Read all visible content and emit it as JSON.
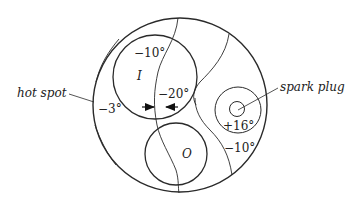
{
  "diagram": {
    "labels": {
      "hot_spot": "hot spot",
      "spark_plug": "spark plug",
      "intake_valve": "I",
      "outlet_valve": "O"
    },
    "temperatures": {
      "intake_top": "−10°",
      "between_valves": "−20°",
      "left_region": "−3°",
      "spark_plug": "+16°",
      "right_lower": "−10°"
    },
    "colors": {
      "line": "#2a2a2a",
      "background": "#ffffff"
    }
  }
}
